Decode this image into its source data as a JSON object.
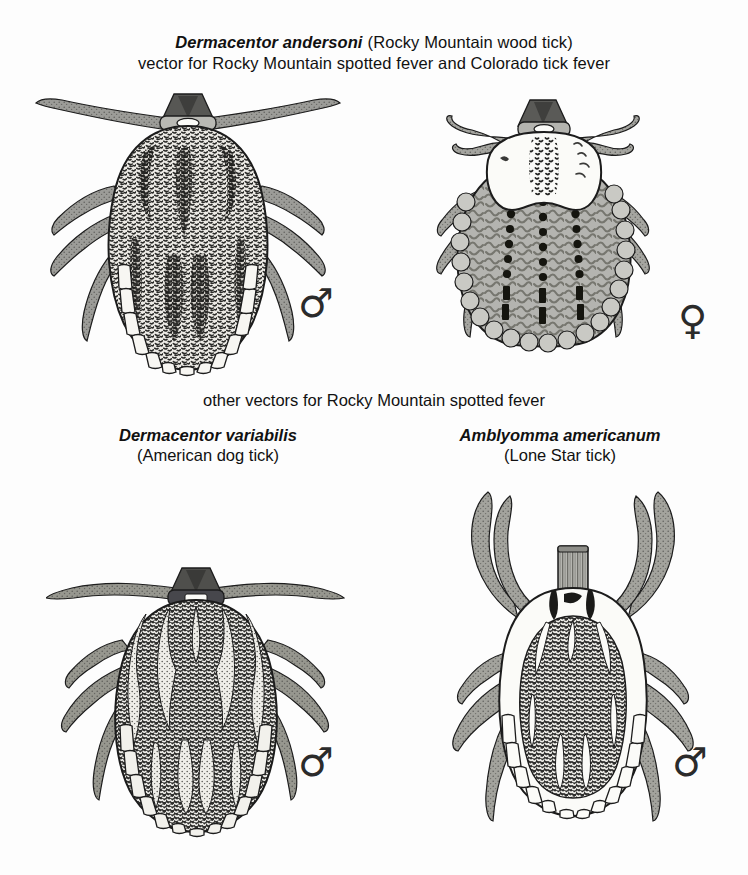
{
  "page": {
    "background_color": "#fdfdfd",
    "ink_color": "#111111",
    "width": 748,
    "height": 875
  },
  "title": {
    "species": "Dermacentor andersoni",
    "common_name": "(Rocky Mountain wood tick)",
    "line1_full": "Dermacentor andersoni (Rocky Mountain wood tick)",
    "line2": "vector for Rocky Mountain spotted fever and Colorado tick fever"
  },
  "section_heading": {
    "text": "other vectors for Rocky Mountain spotted fever"
  },
  "figures": [
    {
      "id": "dermacentor-andersoni-male",
      "species": "Dermacentor andersoni",
      "sex": "male",
      "sex_symbol": "♂",
      "sex_symbol_name": "male-symbol",
      "description": "dorsal view, mottled dark speckled scutum covering whole body, festoons along posterior margin, front legs splayed horizontally",
      "body_fill": "#f2f1ee",
      "leg_fill": "#8d8d8a",
      "outline_color": "#1c1c1c"
    },
    {
      "id": "dermacentor-andersoni-female",
      "species": "Dermacentor andersoni",
      "sex": "female",
      "sex_symbol": "♀",
      "sex_symbol_name": "female-symbol",
      "description": "dorsal view, pale ornate scutum on anterior third, gray alloscutum with three dotted longitudinal rows, ring of pale festoons around margin",
      "body_fill": "#b6b6b2",
      "scutum_fill": "#fbfbf9",
      "leg_fill": "#9a9a96",
      "outline_color": "#1c1c1c"
    },
    {
      "id": "dermacentor-variabilis-male",
      "species": "Dermacentor variabilis",
      "sex": "male",
      "sex_symbol": "♂",
      "sex_symbol_name": "male-symbol",
      "description": "dorsal view, strongly contrasting dark and pale marbled ornamentation over entire scutum, festoons along posterior edge",
      "body_fill": "#3a3a38",
      "ornament_fill": "#f4f3ef",
      "leg_fill": "#8d8d8a",
      "outline_color": "#1c1c1c"
    },
    {
      "id": "amblyomma-americanum-male",
      "species": "Amblyomma americanum",
      "sex": "male",
      "sex_symbol": "♂",
      "sex_symbol_name": "male-symbol",
      "description": "dorsal view, long prominent capitulum projecting forward, pale margin with dark speckled central field, arched front legs, pale festoons",
      "body_fill": "#fbfbf9",
      "center_fill": "#39393a",
      "leg_fill": "#9a9a96",
      "outline_color": "#1c1c1c"
    }
  ],
  "captions": [
    {
      "species": "Dermacentor variabilis",
      "common_name": "(American dog tick)"
    },
    {
      "species": "Amblyomma americanum",
      "common_name": "(Lone Star tick)"
    }
  ]
}
